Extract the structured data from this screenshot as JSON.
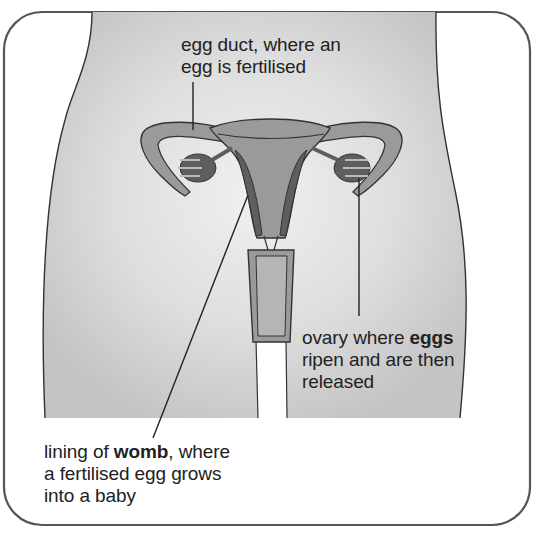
{
  "diagram": {
    "colors": {
      "frame": "#555555",
      "body_fill": "#d9d9d9",
      "organ_fill": "#9a9a9a",
      "organ_dark": "#5e5e5e",
      "outline": "#333333",
      "text": "#222222"
    },
    "labels": {
      "egg_duct": {
        "line1": "egg duct, where an",
        "line2": "egg is fertilised"
      },
      "ovary": {
        "line1_pre": "ovary where ",
        "line1_bold": "eggs",
        "line2": "ripen and are then",
        "line3": "released"
      },
      "womb": {
        "line1_pre": "lining of ",
        "line1_bold": "womb",
        "line1_post": ", where",
        "line2": "a fertilised egg grows",
        "line3": "into a baby"
      }
    }
  }
}
